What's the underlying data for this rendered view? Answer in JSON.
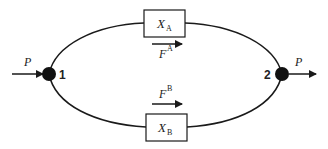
{
  "diagram": {
    "type": "parallel-flow-network",
    "input_label": "P",
    "output_label": "P",
    "nodes": [
      {
        "id": "1",
        "label": "1"
      },
      {
        "id": "2",
        "label": "2"
      }
    ],
    "branches": [
      {
        "name": "A",
        "box_label": "X",
        "box_subscript": "A",
        "force_label": "F",
        "force_superscript": "A"
      },
      {
        "name": "B",
        "box_label": "X",
        "box_subscript": "B",
        "force_label": "F",
        "force_superscript": "B"
      }
    ],
    "colors": {
      "stroke": "#1a1a1a",
      "node_fill": "#111111",
      "background": "#ffffff"
    }
  }
}
